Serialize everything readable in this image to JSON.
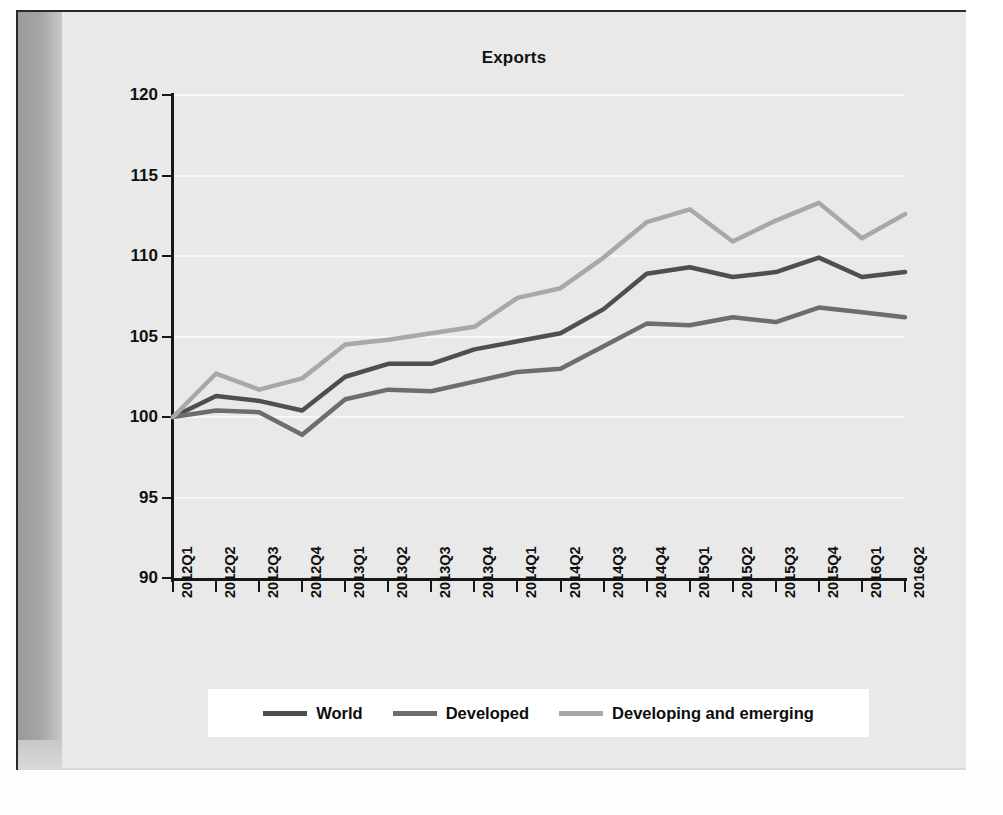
{
  "chart_data": {
    "type": "line",
    "title": "Exports",
    "xlabel": "",
    "ylabel": "",
    "ylim": [
      90,
      120
    ],
    "yticks": [
      90,
      95,
      100,
      105,
      110,
      115,
      120
    ],
    "grid": true,
    "legend_position": "bottom",
    "categories": [
      "2012Q1",
      "2012Q2",
      "2012Q3",
      "2012Q4",
      "2013Q1",
      "2013Q2",
      "2013Q3",
      "2013Q4",
      "2014Q1",
      "2014Q2",
      "2014Q3",
      "2014Q4",
      "2015Q1",
      "2015Q2",
      "2015Q3",
      "2015Q4",
      "2016Q1",
      "2016Q2"
    ],
    "series": [
      {
        "name": "World",
        "color": "#4f4f4f",
        "values": [
          100.0,
          101.3,
          101.0,
          100.4,
          102.5,
          103.3,
          103.3,
          104.2,
          104.7,
          105.2,
          106.7,
          108.9,
          109.3,
          108.7,
          109.0,
          109.9,
          108.7,
          109.0
        ]
      },
      {
        "name": "Developed",
        "color": "#6d6d6d",
        "values": [
          100.0,
          100.4,
          100.3,
          98.9,
          101.1,
          101.7,
          101.6,
          102.2,
          102.8,
          103.0,
          104.4,
          105.8,
          105.7,
          106.2,
          105.9,
          106.8,
          106.5,
          106.2
        ]
      },
      {
        "name": "Developing and emerging",
        "color": "#a8a8a8",
        "values": [
          100.0,
          102.7,
          101.7,
          102.4,
          104.5,
          104.8,
          105.2,
          105.6,
          107.4,
          108.0,
          109.9,
          112.1,
          112.9,
          110.9,
          112.2,
          113.3,
          111.1,
          112.6
        ]
      }
    ]
  },
  "legend": {
    "items": [
      {
        "label": "World",
        "color": "#4f4f4f"
      },
      {
        "label": "Developed",
        "color": "#6d6d6d"
      },
      {
        "label": "Developing and emerging",
        "color": "#a8a8a8"
      }
    ]
  }
}
